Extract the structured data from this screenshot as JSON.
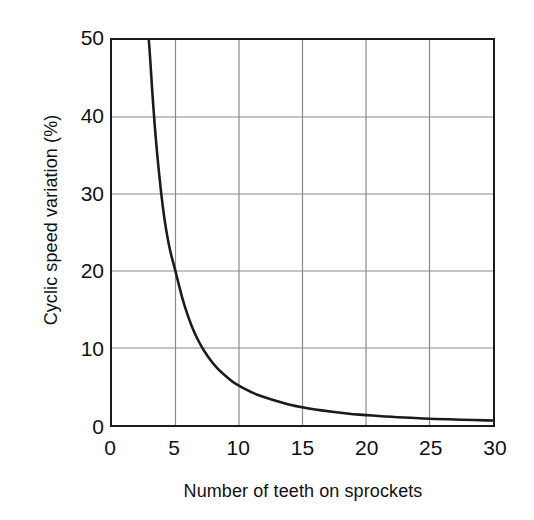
{
  "chart_data": {
    "type": "line",
    "title": "",
    "subtitle": "",
    "xlabel": "Number of teeth on sprockets",
    "ylabel": "Cyclic speed variation (%)",
    "xlim": [
      0,
      30
    ],
    "ylim": [
      0,
      50
    ],
    "xticks": [
      0,
      5,
      10,
      15,
      20,
      25,
      30
    ],
    "yticks": [
      0,
      10,
      20,
      30,
      40,
      50
    ],
    "xtick_labels": [
      "0",
      "5",
      "10",
      "15",
      "20",
      "25",
      "30"
    ],
    "ytick_labels": [
      "0",
      "10",
      "20",
      "30",
      "40",
      "50"
    ],
    "grid": true,
    "grid_color": "#8a8a8a",
    "legend": null,
    "legend_position": "none",
    "series": [
      {
        "name": "Cyclic speed variation",
        "color": "#1b1b1b",
        "line_width": 2.6,
        "x": [
          2.9,
          3.0,
          3.2,
          3.5,
          4.0,
          4.5,
          5.0,
          5.5,
          6.0,
          6.5,
          7.0,
          7.5,
          8.0,
          8.5,
          9.0,
          9.5,
          10.0,
          11.0,
          12.0,
          13.0,
          14.0,
          15.0,
          16.0,
          17.0,
          18.0,
          19.0,
          20.0,
          21.0,
          22.0,
          23.0,
          24.0,
          25.0,
          26.0,
          27.0,
          28.0,
          29.0,
          30.0
        ],
        "y": [
          50.0,
          47.8,
          42.5,
          36.0,
          28.0,
          23.0,
          20.0,
          16.6,
          14.0,
          11.9,
          10.3,
          9.0,
          7.9,
          7.0,
          6.3,
          5.6,
          5.1,
          4.2,
          3.6,
          3.1,
          2.6,
          2.3,
          2.0,
          1.8,
          1.6,
          1.4,
          1.3,
          1.15,
          1.05,
          0.97,
          0.89,
          0.82,
          0.76,
          0.71,
          0.66,
          0.62,
          0.58
        ]
      }
    ]
  },
  "axes": {
    "x_title": "Number of teeth on sprockets",
    "y_title": "Cyclic speed variation (%)"
  },
  "ticks": {
    "x": [
      "0",
      "5",
      "10",
      "15",
      "20",
      "25",
      "30"
    ],
    "y_top_to_bottom": [
      "50",
      "40",
      "30",
      "20",
      "10",
      "0"
    ]
  },
  "colors": {
    "curve": "#1b1b1b",
    "frame": "#1b1b1b",
    "grid": "#8a8a8a",
    "background": "#ffffff",
    "text": "#111111"
  }
}
